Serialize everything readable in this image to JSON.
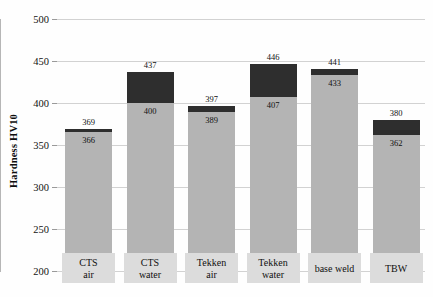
{
  "chart_data": {
    "type": "bar",
    "subtype": "stacked-bar",
    "title": "",
    "xlabel": "",
    "ylabel": "Hardness HV10",
    "ylim": [
      200,
      500
    ],
    "ytick_step": 50,
    "yticks": [
      "500",
      "450",
      "400",
      "350",
      "300",
      "250",
      "200"
    ],
    "grid": true,
    "legend_position": "none",
    "categories": [
      "CTS\nair",
      "CTS\nwater",
      "Tekken\nair",
      "Tekken\nwater",
      "base weld",
      "TBW"
    ],
    "category_lines": [
      [
        "CTS",
        "air"
      ],
      [
        "CTS",
        "water"
      ],
      [
        "Tekken",
        "air"
      ],
      [
        "Tekken",
        "water"
      ],
      [
        "base weld",
        ""
      ],
      [
        "TBW",
        ""
      ]
    ],
    "series": [
      {
        "name": "lower",
        "color": "#b4b4b4",
        "values": [
          366,
          400,
          389,
          407,
          433,
          362
        ]
      },
      {
        "name": "upper-total",
        "color": "#2e2e2e",
        "values": [
          369,
          437,
          397,
          446,
          441,
          380
        ]
      }
    ],
    "inner_labels": [
      "366",
      "400",
      "389",
      "407",
      "433",
      "362"
    ],
    "total_labels": [
      "369",
      "437",
      "397",
      "446",
      "441",
      "380"
    ]
  },
  "colors": {
    "light_segment": "#b4b4b4",
    "dark_segment": "#2e2e2e",
    "gridline": "#d2d2d2",
    "category_box": "#dcdcdc",
    "text": "#111111",
    "background": "#fefefe"
  }
}
